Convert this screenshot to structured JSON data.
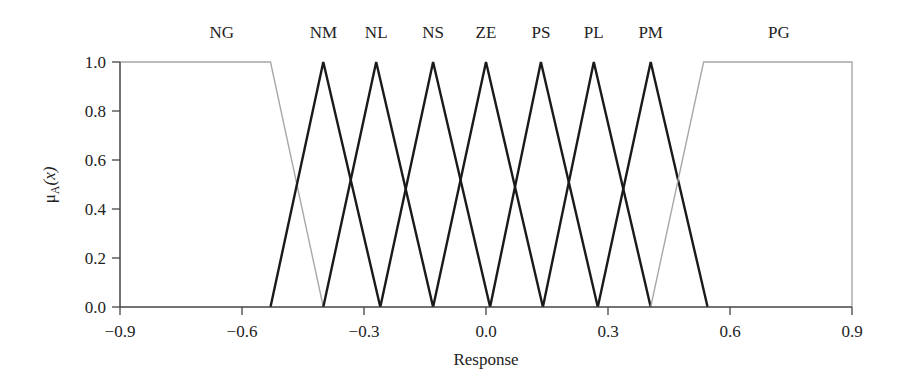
{
  "chart_data": {
    "type": "line",
    "title": "",
    "xlabel": "Response",
    "ylabel": "μA(x)",
    "ylabel_main": "μ",
    "ylabel_sub": "A",
    "ylabel_arg": "(x)",
    "xlim": [
      -0.9,
      0.9
    ],
    "ylim": [
      0.0,
      1.0
    ],
    "xticks": [
      -0.9,
      -0.6,
      -0.3,
      0.0,
      0.3,
      0.6,
      0.9
    ],
    "xtick_labels": [
      "−0.9",
      "−0.6",
      "−0.3",
      "0.0",
      "0.3",
      "0.6",
      "0.9"
    ],
    "yticks": [
      0.0,
      0.2,
      0.4,
      0.6,
      0.8,
      1.0
    ],
    "ytick_labels": [
      "0.0",
      "0.2",
      "0.4",
      "0.6",
      "0.8",
      "1.0"
    ],
    "grid": false,
    "legend": "labels above each membership function",
    "series": [
      {
        "name": "NG",
        "color": "#a8a8a8",
        "x": [
          -0.9,
          -0.53,
          -0.4
        ],
        "y": [
          1.0,
          1.0,
          0.0
        ],
        "label_x": -0.65
      },
      {
        "name": "NM",
        "color": "#1a1a1a",
        "x": [
          -0.53,
          -0.4,
          -0.26
        ],
        "y": [
          0.0,
          1.0,
          0.0
        ],
        "label_x": -0.4
      },
      {
        "name": "NL",
        "color": "#1a1a1a",
        "x": [
          -0.4,
          -0.27,
          -0.13
        ],
        "y": [
          0.0,
          1.0,
          0.0
        ],
        "label_x": -0.27
      },
      {
        "name": "NS",
        "color": "#1a1a1a",
        "x": [
          -0.26,
          -0.13,
          0.01
        ],
        "y": [
          0.0,
          1.0,
          0.0
        ],
        "label_x": -0.13
      },
      {
        "name": "ZE",
        "color": "#1a1a1a",
        "x": [
          -0.13,
          0.0,
          0.14
        ],
        "y": [
          0.0,
          1.0,
          0.0
        ],
        "label_x": 0.0
      },
      {
        "name": "PS",
        "color": "#1a1a1a",
        "x": [
          0.01,
          0.135,
          0.275
        ],
        "y": [
          0.0,
          1.0,
          0.0
        ],
        "label_x": 0.135
      },
      {
        "name": "PL",
        "color": "#1a1a1a",
        "x": [
          0.14,
          0.265,
          0.405
        ],
        "y": [
          0.0,
          1.0,
          0.0
        ],
        "label_x": 0.265
      },
      {
        "name": "PM",
        "color": "#1a1a1a",
        "x": [
          0.275,
          0.405,
          0.545
        ],
        "y": [
          0.0,
          1.0,
          0.0
        ],
        "label_x": 0.405
      },
      {
        "name": "PG",
        "color": "#a8a8a8",
        "x": [
          0.405,
          0.535,
          0.9,
          0.9
        ],
        "y": [
          0.0,
          1.0,
          1.0,
          0.0
        ],
        "label_x": 0.72
      }
    ]
  }
}
